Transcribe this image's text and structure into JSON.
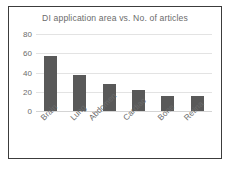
{
  "chart_data": {
    "type": "bar",
    "title": "DI application area vs. No. of articles",
    "xlabel": "",
    "ylabel": "",
    "categories": [
      "Brain",
      "Lung",
      "Abdomen",
      "Cardiac",
      "Bone",
      "Retina"
    ],
    "values": [
      57,
      37,
      28,
      22,
      16,
      16
    ],
    "yticks": [
      80,
      60,
      40,
      20,
      0
    ],
    "ylim": [
      0,
      80
    ],
    "grid": true,
    "legend": "none",
    "colors": {
      "bar": "#595959",
      "gridline": "#e3e3e3",
      "text": "#6b6b6b",
      "border": "#3c3c3c",
      "background": "#ffffff"
    }
  }
}
